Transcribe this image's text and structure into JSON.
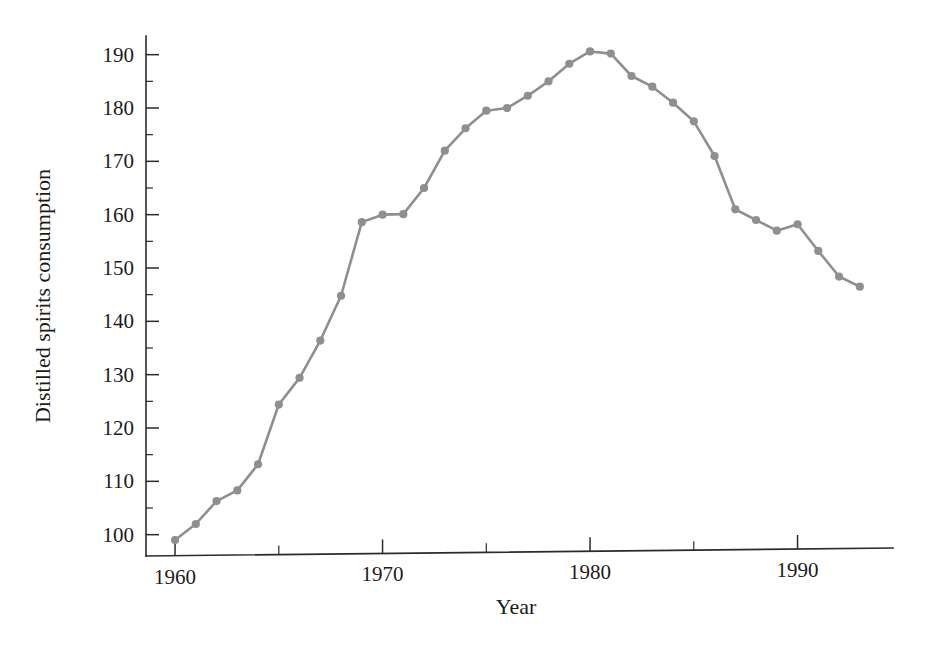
{
  "chart_data": {
    "type": "line",
    "title": "",
    "subtitle": "",
    "xlabel": "Year",
    "ylabel": "Distilled spirits consumption",
    "xlim": [
      1958.6,
      1994.6
    ],
    "ylim": [
      96.0,
      193.5
    ],
    "grid": false,
    "legend": false,
    "legend_position": "none",
    "x_major_ticks": [
      1960,
      1970,
      1980,
      1990
    ],
    "x_major_tick_labels": [
      "1960",
      "1970",
      "1980",
      "1990"
    ],
    "x_minor_ticks": [
      1965,
      1975,
      1985
    ],
    "y_major_ticks": [
      100,
      110,
      120,
      130,
      140,
      150,
      160,
      170,
      180,
      190
    ],
    "y_major_tick_labels": [
      "100",
      "110",
      "120",
      "130",
      "140",
      "150",
      "160",
      "170",
      "180",
      "190"
    ],
    "y_minor_ticks": [
      105,
      115,
      125,
      135,
      145,
      155,
      165,
      175,
      185
    ],
    "marker": "circle",
    "marker_size": 4.1,
    "line_color": "#8f8f8f",
    "marker_color": "#8f8f8f",
    "axis_color": "#2b2b2b",
    "background_color": "#ffffff",
    "x": [
      1960,
      1961,
      1962,
      1963,
      1964,
      1965,
      1966,
      1967,
      1968,
      1969,
      1970,
      1971,
      1972,
      1973,
      1974,
      1975,
      1976,
      1977,
      1978,
      1979,
      1980,
      1981,
      1982,
      1983,
      1984,
      1985,
      1986,
      1987,
      1988,
      1989,
      1990,
      1991,
      1992,
      1993
    ],
    "values": [
      99.0,
      102.0,
      106.3,
      108.3,
      113.2,
      124.4,
      129.4,
      136.4,
      144.8,
      158.6,
      160.0,
      160.1,
      165.0,
      172.0,
      176.2,
      179.5,
      180.0,
      182.3,
      185.0,
      188.3,
      190.6,
      190.2,
      186.0,
      184.0,
      181.0,
      177.5,
      171.0,
      161.0,
      159.0,
      157.0,
      158.2,
      153.2,
      148.4,
      146.5
    ],
    "series": [
      {
        "name": "Distilled spirits consumption",
        "values": [
          99.0,
          102.0,
          106.3,
          108.3,
          113.2,
          124.4,
          129.4,
          136.4,
          144.8,
          158.6,
          160.0,
          160.1,
          165.0,
          172.0,
          176.2,
          179.5,
          180.0,
          182.3,
          185.0,
          188.3,
          190.6,
          190.2,
          186.0,
          184.0,
          181.0,
          177.5,
          171.0,
          161.0,
          159.0,
          157.0,
          158.2,
          153.2,
          148.4,
          146.5
        ]
      }
    ],
    "annotations": []
  },
  "figure": {
    "x_axis_title": "Year",
    "y_axis_title": "Distilled spirits consumption"
  }
}
